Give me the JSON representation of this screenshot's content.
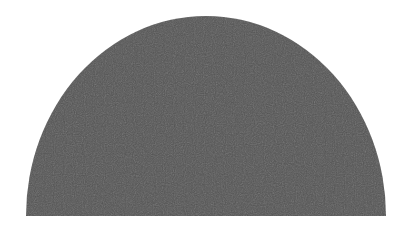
{
  "figure": {
    "shape": "semicircle",
    "fill_color": "#555555",
    "background_color": "#ffffff",
    "orientation": "flat-side-down"
  }
}
